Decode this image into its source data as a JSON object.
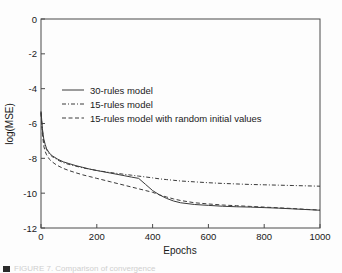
{
  "figure": {
    "background_color": "#fdfdfd",
    "axis_color": "#4a4a4a",
    "curve_color": "#3a3a3a"
  },
  "caption": {
    "text": "FIGURE 7. Comparison of convergence"
  },
  "chart_data": {
    "type": "line",
    "title": "",
    "xlabel": "Epochs",
    "ylabel": "log(MSE)",
    "xlim": [
      0,
      1000
    ],
    "ylim": [
      -12,
      0
    ],
    "xticks": [
      0,
      200,
      400,
      600,
      800,
      1000
    ],
    "yticks": [
      0,
      -2,
      -4,
      -6,
      -8,
      -10,
      -12
    ],
    "xticklabels": [
      "0",
      "200",
      "400",
      "600",
      "800",
      "1000"
    ],
    "yticklabels": [
      "0",
      "-2",
      "-4",
      "-6",
      "-8",
      "-10",
      "-12"
    ],
    "grid": false,
    "legend_position": "upper center",
    "x": [
      0,
      5,
      10,
      15,
      20,
      30,
      40,
      50,
      60,
      80,
      100,
      125,
      150,
      175,
      200,
      250,
      300,
      325,
      350,
      375,
      400,
      425,
      450,
      475,
      500,
      550,
      600,
      650,
      700,
      750,
      800,
      850,
      900,
      950,
      1000
    ],
    "series": [
      {
        "name": "30-rules model",
        "linestyle": "solid",
        "values": [
          -5.3,
          -6.3,
          -6.9,
          -7.2,
          -7.45,
          -7.7,
          -7.85,
          -7.95,
          -8.05,
          -8.2,
          -8.3,
          -8.42,
          -8.52,
          -8.62,
          -8.7,
          -8.85,
          -9.0,
          -9.08,
          -9.15,
          -9.5,
          -9.85,
          -10.1,
          -10.3,
          -10.45,
          -10.55,
          -10.65,
          -10.7,
          -10.75,
          -10.78,
          -10.8,
          -10.83,
          -10.86,
          -10.9,
          -10.94,
          -10.98
        ]
      },
      {
        "name": "15-rules model",
        "linestyle": "dashdot",
        "values": [
          -5.35,
          -6.4,
          -7.0,
          -7.3,
          -7.5,
          -7.75,
          -7.9,
          -8.0,
          -8.1,
          -8.25,
          -8.35,
          -8.45,
          -8.55,
          -8.62,
          -8.7,
          -8.82,
          -8.92,
          -8.97,
          -9.02,
          -9.07,
          -9.12,
          -9.18,
          -9.22,
          -9.26,
          -9.3,
          -9.35,
          -9.4,
          -9.44,
          -9.47,
          -9.5,
          -9.52,
          -9.54,
          -9.56,
          -9.58,
          -9.6
        ]
      },
      {
        "name": "15-rules model with random initial values",
        "linestyle": "dashed",
        "values": [
          -5.4,
          -6.6,
          -7.3,
          -7.6,
          -7.8,
          -8.05,
          -8.2,
          -8.32,
          -8.42,
          -8.58,
          -8.7,
          -8.83,
          -8.95,
          -9.05,
          -9.15,
          -9.35,
          -9.55,
          -9.65,
          -9.75,
          -9.85,
          -9.95,
          -10.1,
          -10.22,
          -10.33,
          -10.42,
          -10.55,
          -10.62,
          -10.68,
          -10.72,
          -10.76,
          -10.8,
          -10.84,
          -10.88,
          -10.93,
          -10.97
        ]
      }
    ],
    "legend_entries": [
      {
        "label": "30-rules model",
        "linestyle": "solid"
      },
      {
        "label": "15-rules model",
        "linestyle": "dashdot"
      },
      {
        "label": "15-rules model with random initial values",
        "linestyle": "dashed"
      }
    ]
  }
}
